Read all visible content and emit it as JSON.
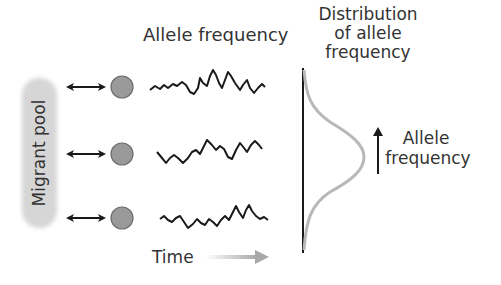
{
  "labels": {
    "allele_frequency_header": "Allele frequency",
    "distribution_title_lines": [
      "Distribution",
      "of allele",
      "frequency"
    ],
    "migrant_pool": "Migrant pool",
    "time": "Time",
    "axis_label_lines": [
      "Allele",
      "frequency"
    ]
  },
  "populations": [
    {
      "id": "pop-1",
      "y": 87
    },
    {
      "id": "pop-2",
      "y": 154
    },
    {
      "id": "pop-3",
      "y": 218
    }
  ],
  "colors": {
    "circle_fill": "#9a9a9a",
    "circle_stroke": "#6e6e6e",
    "bell_curve": "#b8b8b8",
    "pool_fill": "#d6d6d6",
    "ink": "#1a1a1a"
  }
}
